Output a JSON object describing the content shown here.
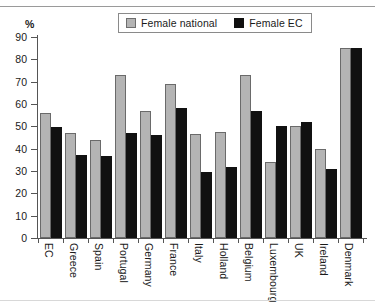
{
  "chart_data": {
    "type": "bar",
    "title": "",
    "xlabel": "",
    "ylabel": "%",
    "ylim": [
      0,
      90
    ],
    "yticks": [
      0,
      10,
      20,
      30,
      40,
      50,
      60,
      70,
      80,
      90
    ],
    "grid": false,
    "legend_position": "top-center",
    "categories": [
      "EC",
      "Greece",
      "Spain",
      "Portugal",
      "Germany",
      "France",
      "Italy",
      "Holland",
      "Belgium",
      "Luxembourg",
      "UK",
      "Ireland",
      "Denmark"
    ],
    "series": [
      {
        "name": "Female national",
        "color": "#b4b4b4",
        "values": [
          56,
          47,
          44,
          73,
          57,
          69,
          46.5,
          47.5,
          73,
          34,
          50,
          40,
          85
        ]
      },
      {
        "name": "Female EC",
        "color": "#111111",
        "values": [
          49.5,
          37,
          36.5,
          47,
          46,
          58,
          29.5,
          32,
          57,
          50,
          52,
          31,
          85
        ]
      }
    ]
  },
  "legend": {
    "items": [
      {
        "label": "Female national",
        "swatch": "national"
      },
      {
        "label": "Female EC",
        "swatch": "ec"
      }
    ]
  },
  "axis": {
    "unit_label": "%"
  },
  "footnote": ""
}
